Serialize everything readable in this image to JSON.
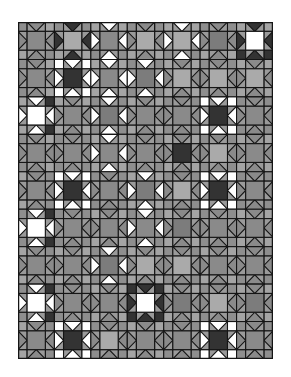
{
  "image": {
    "description": "Quilt pattern: grid of Ohio-star style blocks with square-in-square connectors",
    "width": 291,
    "height": 377
  },
  "quilt": {
    "left": 18,
    "top": 22,
    "width": 255,
    "height": 337,
    "cols": 7,
    "rows": 9,
    "colors": {
      "line": "#151515",
      "background_square": "#8e8e8e",
      "background_square_alt": "#a4a4a4",
      "connector": "#9a9a9a",
      "dark": "#333333",
      "gray": "#8a8a8a",
      "midgray": "#7c7c7c",
      "lightgray": "#aaaaaa",
      "white": "#ffffff"
    },
    "stars": [
      [
        {
          "c": "gray",
          "p": "gray"
        },
        {
          "c": "lightgray",
          "p": "dark"
        },
        {
          "c": "gray",
          "p": "white"
        },
        {
          "c": "lightgray",
          "p": "gray"
        },
        {
          "c": "lightgray",
          "p": "white"
        },
        {
          "c": "midgray",
          "p": "gray"
        },
        {
          "c": "white",
          "p": "dark"
        }
      ],
      [
        {
          "c": "gray",
          "p": "gray"
        },
        {
          "c": "dark",
          "p": "white"
        },
        {
          "c": "gray",
          "p": "white"
        },
        {
          "c": "midgray",
          "p": "white"
        },
        {
          "c": "lightgray",
          "p": "gray"
        },
        {
          "c": "lightgray",
          "p": "gray"
        },
        {
          "c": "lightgray",
          "p": "gray"
        }
      ],
      [
        {
          "c": "white",
          "p": "white"
        },
        {
          "c": "gray",
          "p": "gray"
        },
        {
          "c": "midgray",
          "p": "white"
        },
        {
          "c": "gray",
          "p": "gray"
        },
        {
          "c": "gray",
          "p": "gray"
        },
        {
          "c": "dark",
          "p": "white"
        },
        {
          "c": "gray",
          "p": "gray"
        }
      ],
      [
        {
          "c": "gray",
          "p": "gray"
        },
        {
          "c": "gray",
          "p": "gray"
        },
        {
          "c": "gray",
          "p": "white"
        },
        {
          "c": "gray",
          "p": "gray"
        },
        {
          "c": "dark",
          "p": "gray"
        },
        {
          "c": "lightgray",
          "p": "gray"
        },
        {
          "c": "gray",
          "p": "gray"
        }
      ],
      [
        {
          "c": "gray",
          "p": "gray"
        },
        {
          "c": "dark",
          "p": "white"
        },
        {
          "c": "gray",
          "p": "gray"
        },
        {
          "c": "midgray",
          "p": "white"
        },
        {
          "c": "lightgray",
          "p": "gray"
        },
        {
          "c": "dark",
          "p": "white"
        },
        {
          "c": "gray",
          "p": "gray"
        }
      ],
      [
        {
          "c": "white",
          "p": "white"
        },
        {
          "c": "gray",
          "p": "gray"
        },
        {
          "c": "gray",
          "p": "gray"
        },
        {
          "c": "gray",
          "p": "white"
        },
        {
          "c": "midgray",
          "p": "gray"
        },
        {
          "c": "gray",
          "p": "gray"
        },
        {
          "c": "gray",
          "p": "gray"
        }
      ],
      [
        {
          "c": "gray",
          "p": "gray"
        },
        {
          "c": "gray",
          "p": "gray"
        },
        {
          "c": "midgray",
          "p": "white"
        },
        {
          "c": "lightgray",
          "p": "gray"
        },
        {
          "c": "lightgray",
          "p": "gray"
        },
        {
          "c": "gray",
          "p": "gray"
        },
        {
          "c": "gray",
          "p": "gray"
        }
      ],
      [
        {
          "c": "white",
          "p": "white"
        },
        {
          "c": "gray",
          "p": "gray"
        },
        {
          "c": "gray",
          "p": "gray"
        },
        {
          "c": "white",
          "p": "dark"
        },
        {
          "c": "midgray",
          "p": "gray"
        },
        {
          "c": "lightgray",
          "p": "gray"
        },
        {
          "c": "midgray",
          "p": "gray"
        }
      ],
      [
        {
          "c": "gray",
          "p": "gray"
        },
        {
          "c": "dark",
          "p": "white"
        },
        {
          "c": "lightgray",
          "p": "gray"
        },
        {
          "c": "gray",
          "p": "gray"
        },
        {
          "c": "gray",
          "p": "gray"
        },
        {
          "c": "dark",
          "p": "white"
        },
        {
          "c": "gray",
          "p": "gray"
        }
      ]
    ]
  }
}
